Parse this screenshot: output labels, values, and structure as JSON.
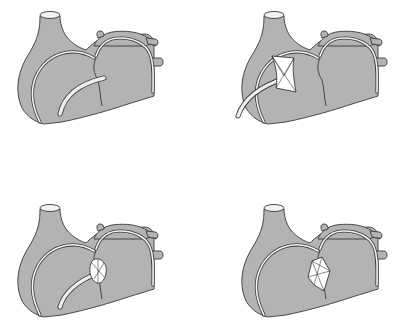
{
  "figure": {
    "colors": {
      "tissue": "#b3b3b3",
      "outline": "#3a3a3a",
      "catheter": "#eeeeee",
      "device": "#ffffff",
      "background": "#ffffff"
    },
    "panels": [
      {
        "step": 1,
        "stage": "catheter-advanced",
        "device": "none"
      },
      {
        "step": 2,
        "stage": "left-disc-deployed",
        "device": "square-disc"
      },
      {
        "step": 3,
        "stage": "device-pulled-to-septum",
        "device": "collapsed-disc"
      },
      {
        "step": 4,
        "stage": "device-released",
        "device": "released-occluder"
      }
    ]
  }
}
